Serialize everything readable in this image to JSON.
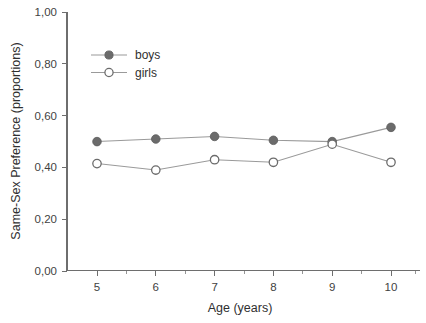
{
  "chart_data": {
    "type": "line",
    "title": "",
    "xlabel": "Age (years)",
    "ylabel": "Same-Sex Preference (proportions)",
    "categories": [
      "5",
      "6",
      "7",
      "8",
      "9",
      "10"
    ],
    "x": [
      5,
      6,
      7,
      8,
      9,
      10
    ],
    "xlim": [
      4.6,
      10.6
    ],
    "ylim": [
      0.0,
      1.0
    ],
    "grid": false,
    "legend_position": "upper-left-inside",
    "x_tick_labels": [
      "5",
      "6",
      "7",
      "8",
      "9",
      "10"
    ],
    "y_tick_labels": [
      "0,00",
      "0,20",
      "0,40",
      "0,60",
      "0,80",
      "1,00"
    ],
    "y_tick_values": [
      0.0,
      0.2,
      0.4,
      0.6,
      0.8,
      1.0
    ],
    "series": [
      {
        "name": "boys",
        "marker": "filled-circle",
        "color": "#6b6b6b",
        "values": [
          0.5,
          0.51,
          0.52,
          0.505,
          0.5,
          0.555
        ]
      },
      {
        "name": "girls",
        "marker": "open-circle",
        "color": "#ffffff",
        "values": [
          0.415,
          0.39,
          0.43,
          0.42,
          0.49,
          0.42
        ]
      }
    ]
  },
  "legend": {
    "items": [
      {
        "label": "boys"
      },
      {
        "label": "girls"
      }
    ]
  },
  "colors": {
    "background": "#ffffff",
    "axis": "#6e6e6e",
    "line": "#9a9a9a",
    "marker_fill": "#6b6b6b",
    "text": "#2f2f2f"
  }
}
